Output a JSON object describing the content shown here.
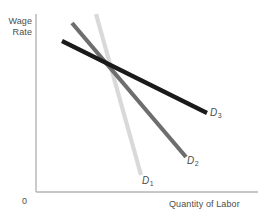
{
  "figure": {
    "background": "#ffffff",
    "width": 265,
    "height": 223
  },
  "axes": {
    "y_title_line1": "Wage",
    "y_title_line2": "Rate",
    "x_title": "Quantity of Labor",
    "origin_label": "0",
    "axis_color": "#b5b5b5",
    "label_color": "#4d4d4d"
  },
  "curves": {
    "d1": {
      "name": "D",
      "subscript": "1"
    },
    "d2": {
      "name": "D",
      "subscript": "2"
    },
    "d3": {
      "name": "D",
      "subscript": "3"
    }
  },
  "chart_data": {
    "type": "line",
    "title": "",
    "xlabel": "Quantity of Labor",
    "ylabel": "Wage Rate",
    "grid": false,
    "legend": "inline-end-labels",
    "axis_origin_label": "0",
    "xlim": [
      0,
      1
    ],
    "ylim": [
      0,
      1
    ],
    "annotations": [
      "D1",
      "D2",
      "D3"
    ],
    "note": "Three downward-sloping labor demand curves of differing elasticity, all intersecting at a common point; D1 steepest (least elastic), D3 flattest (most elastic).",
    "series": [
      {
        "name": "D1",
        "label": "D₁",
        "color": "#d9d9d9",
        "width": 4.2,
        "elasticity": "least elastic (steepest)",
        "x": [
          0.271,
          0.474
        ],
        "y": [
          1.0,
          0.09
        ],
        "pixel_points": [
          [
            96,
            14
          ],
          [
            141,
            175
          ]
        ]
      },
      {
        "name": "D2",
        "label": "D₂",
        "color": "#6e6e6e",
        "width": 4.2,
        "elasticity": "intermediate elasticity",
        "x": [
          0.162,
          0.676
        ],
        "y": [
          0.955,
          0.198
        ],
        "pixel_points": [
          [
            72,
            23
          ],
          [
            186,
            157
          ]
        ]
      },
      {
        "name": "D3",
        "label": "D₃",
        "color": "#1a1a1a",
        "width": 4.2,
        "elasticity": "most elastic (flattest)",
        "x": [
          0.117,
          0.77
        ],
        "y": [
          0.853,
          0.446
        ],
        "pixel_points": [
          [
            62,
            41
          ],
          [
            207,
            113
          ]
        ]
      }
    ],
    "intersection": {
      "x": 0.32,
      "y": 0.729,
      "pixel_point": [
        107,
        63
      ]
    }
  }
}
